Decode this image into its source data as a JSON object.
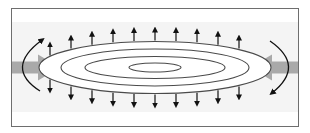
{
  "diagram": {
    "title": "",
    "contour_count": 4,
    "top_arrow_count": 10,
    "bottom_arrow_count": 10,
    "inflow_arrows": [
      "left",
      "right"
    ],
    "colors": {
      "frame": "#6e6e6e",
      "band": "#f2f2f2",
      "inflow": "#a9a9a9",
      "contour": "#4a4a4a",
      "arrow": "#111111"
    }
  }
}
